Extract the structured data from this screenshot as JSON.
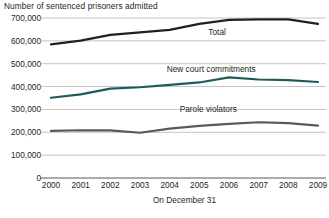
{
  "chart_data": {
    "type": "line",
    "title": "Number of sentenced prisoners admitted",
    "xlabel": "On December 31",
    "ylabel": "",
    "categories": [
      "2000",
      "2001",
      "2002",
      "2003",
      "2004",
      "2005",
      "2006",
      "2007",
      "2008",
      "2009"
    ],
    "x": [
      2000,
      2001,
      2002,
      2003,
      2004,
      2005,
      2006,
      2007,
      2008,
      2009
    ],
    "ylim": [
      0,
      700000
    ],
    "yticks": [
      0,
      100000,
      200000,
      300000,
      400000,
      500000,
      600000,
      700000
    ],
    "ytick_labels": [
      "0",
      "100,000",
      "200,000",
      "300,000",
      "400,000",
      "500,000",
      "600,000",
      "700,000"
    ],
    "grid": true,
    "legend_position": "inline-annotations",
    "series": [
      {
        "name": "Total",
        "color": "#231f20",
        "values": [
          585000,
          601000,
          626000,
          637000,
          648000,
          674000,
          692000,
          694000,
          694000,
          674000
        ],
        "label_x": 2005.6,
        "label_y": 637000
      },
      {
        "name": "New court commitments",
        "color": "#1d5c5a",
        "values": [
          351000,
          366000,
          391000,
          397000,
          407000,
          418000,
          440000,
          431000,
          428000,
          420000
        ],
        "label_x": 2005.4,
        "label_y": 478000
      },
      {
        "name": "Parole violators",
        "color": "#58595b",
        "values": [
          206000,
          209000,
          208000,
          198000,
          216000,
          228000,
          237000,
          244000,
          240000,
          229000
        ],
        "label_x": 2005.3,
        "label_y": 300000
      }
    ]
  }
}
